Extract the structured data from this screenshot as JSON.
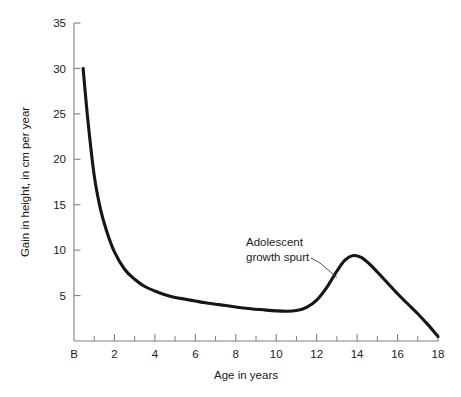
{
  "chart_data": {
    "type": "line",
    "title": "",
    "subtitle": "",
    "xlabel": "Age in years",
    "ylabel": "Gain in height, in cm per year",
    "xlim": [
      0,
      18
    ],
    "ylim": [
      0,
      35
    ],
    "grid": false,
    "legend": null,
    "x_tick_labels": [
      "B",
      "2",
      "4",
      "6",
      "8",
      "10",
      "12",
      "14",
      "16",
      "18"
    ],
    "x_tick_values": [
      0,
      2,
      4,
      6,
      8,
      10,
      12,
      14,
      16,
      18
    ],
    "x_minor_tick_values": [
      1,
      3,
      5,
      7,
      9,
      11,
      13,
      15,
      17
    ],
    "y_tick_labels": [
      "5",
      "10",
      "15",
      "20",
      "25",
      "30",
      "35"
    ],
    "y_tick_values": [
      5,
      10,
      15,
      20,
      25,
      30,
      35
    ],
    "series": [
      {
        "name": "Height velocity",
        "x": [
          0.45,
          0.7,
          1.0,
          1.3,
          1.6,
          2.0,
          2.5,
          3.0,
          3.5,
          4.0,
          4.5,
          5.0,
          5.5,
          6.0,
          6.5,
          7.0,
          7.5,
          8.0,
          8.5,
          9.0,
          9.5,
          10.0,
          10.5,
          11.0,
          11.5,
          12.0,
          12.5,
          13.0,
          13.4,
          13.8,
          14.2,
          14.6,
          15.0,
          15.5,
          16.0,
          16.5,
          17.0,
          17.5,
          18.0
        ],
        "values": [
          30.0,
          24.0,
          18.2,
          14.6,
          12.2,
          9.8,
          7.9,
          6.8,
          6.0,
          5.5,
          5.1,
          4.8,
          4.6,
          4.4,
          4.2,
          4.05,
          3.9,
          3.75,
          3.6,
          3.5,
          3.4,
          3.32,
          3.28,
          3.35,
          3.7,
          4.5,
          5.9,
          7.7,
          8.9,
          9.4,
          9.2,
          8.5,
          7.6,
          6.4,
          5.2,
          4.1,
          3.0,
          1.8,
          0.5
        ]
      }
    ],
    "annotations": [
      {
        "text_line1": "Adolescent",
        "text_line2": "growth spurt",
        "points_to_x": 13.0,
        "points_to_y": 7.0
      }
    ]
  },
  "axis_color": "#808080",
  "curve_color": "#16161a"
}
